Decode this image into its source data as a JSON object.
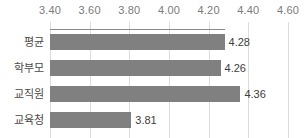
{
  "chart_data": {
    "type": "bar",
    "orientation": "horizontal",
    "title": "",
    "subtitle": "",
    "xlabel": "",
    "ylabel": "",
    "categories": [
      "평균",
      "학부모",
      "교직원",
      "교육청"
    ],
    "values": [
      4.28,
      4.26,
      4.36,
      3.81
    ],
    "value_labels": [
      "4.28",
      "4.26",
      "4.36",
      "3.81"
    ],
    "xlim": [
      3.4,
      4.6
    ],
    "xticks": [
      3.4,
      3.6,
      3.8,
      4.0,
      4.2,
      4.4,
      4.6
    ],
    "xtick_labels": [
      "3.40",
      "3.60",
      "3.80",
      "4.00",
      "4.20",
      "4.40",
      "4.60"
    ],
    "grid": true,
    "grid_axis": "x",
    "legend": false,
    "legend_position": "none",
    "axis_position": "top",
    "colors": {
      "bar": "#808080",
      "gridline": "#dcdcdc",
      "axis_rule": "#8a8a8a",
      "tick_text": "#7b7b7b",
      "category_text": "#4a4a4a",
      "value_text": "#3d3d3d",
      "background": "#ffffff"
    }
  }
}
